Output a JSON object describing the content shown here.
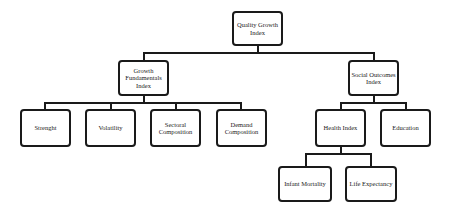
{
  "diagram": {
    "type": "hierarchy",
    "root": {
      "label": "Quality Growth Index"
    },
    "level1": [
      {
        "label": "Growth Fundamentals Index"
      },
      {
        "label": "Social Outcomes Index"
      }
    ],
    "growth_children": [
      {
        "label": "Strenght"
      },
      {
        "label": "Volatility"
      },
      {
        "label": "Sectoral Composition"
      },
      {
        "label": "Demand Composition"
      }
    ],
    "social_children": [
      {
        "label": "Health Index"
      },
      {
        "label": "Education"
      }
    ],
    "health_children": [
      {
        "label": "Infant Mortality"
      },
      {
        "label": "Life Expectancy"
      }
    ]
  }
}
